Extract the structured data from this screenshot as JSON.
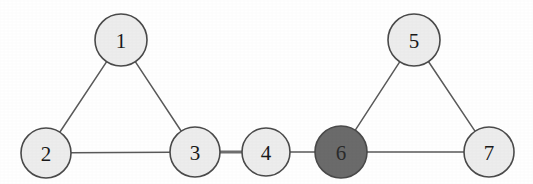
{
  "figure": {
    "kind": "undirected-graph",
    "background_color": "#ffffff",
    "width": 533,
    "height": 184
  },
  "chart_data": {
    "type": "diagram",
    "title": "",
    "subtitle": "",
    "xlabel": "",
    "ylabel": "",
    "graph_type": "undirected graph",
    "node_count": 7,
    "edge_count": 8,
    "nodes": [
      {
        "id": "1",
        "label": "1",
        "x": 121,
        "y": 40,
        "r": 26,
        "fill": "#ededed",
        "stroke": "#4a4a4a",
        "text_color": "#1a1a1a",
        "highlighted": false
      },
      {
        "id": "2",
        "label": "2",
        "x": 46,
        "y": 153,
        "r": 25,
        "fill": "#ededed",
        "stroke": "#4a4a4a",
        "text_color": "#1a1a1a",
        "highlighted": false
      },
      {
        "id": "3",
        "label": "3",
        "x": 195,
        "y": 152,
        "r": 25,
        "fill": "#ededed",
        "stroke": "#4a4a4a",
        "text_color": "#1a1a1a",
        "highlighted": false
      },
      {
        "id": "4",
        "label": "4",
        "x": 266,
        "y": 152,
        "r": 24,
        "fill": "#ededed",
        "stroke": "#4a4a4a",
        "text_color": "#1a1a1a",
        "highlighted": false
      },
      {
        "id": "5",
        "label": "5",
        "x": 414,
        "y": 40,
        "r": 26,
        "fill": "#ededed",
        "stroke": "#4a4a4a",
        "text_color": "#1a1a1a",
        "highlighted": false
      },
      {
        "id": "6",
        "label": "6",
        "x": 341,
        "y": 152,
        "r": 26,
        "fill": "#6b6b6b",
        "stroke": "#4a4a4a",
        "text_color": "#2b2b2b",
        "highlighted": true
      },
      {
        "id": "7",
        "label": "7",
        "x": 489,
        "y": 152,
        "r": 25,
        "fill": "#ededed",
        "stroke": "#4a4a4a",
        "text_color": "#1a1a1a",
        "highlighted": false
      }
    ],
    "edges": [
      {
        "from": "1",
        "to": "2",
        "emphasis": false
      },
      {
        "from": "1",
        "to": "3",
        "emphasis": false
      },
      {
        "from": "2",
        "to": "3",
        "emphasis": false
      },
      {
        "from": "3",
        "to": "4",
        "emphasis": true
      },
      {
        "from": "4",
        "to": "6",
        "emphasis": false
      },
      {
        "from": "6",
        "to": "5",
        "emphasis": false
      },
      {
        "from": "6",
        "to": "7",
        "emphasis": false
      },
      {
        "from": "5",
        "to": "7",
        "emphasis": false
      }
    ],
    "colors": {
      "node_fill_default": "#ededed",
      "node_fill_highlight": "#6b6b6b",
      "node_stroke": "#4a4a4a",
      "edge_stroke": "#5a5a5a",
      "edge_stroke_emphasis": "#6e6e6e",
      "background": "#ffffff"
    },
    "annotations": []
  }
}
